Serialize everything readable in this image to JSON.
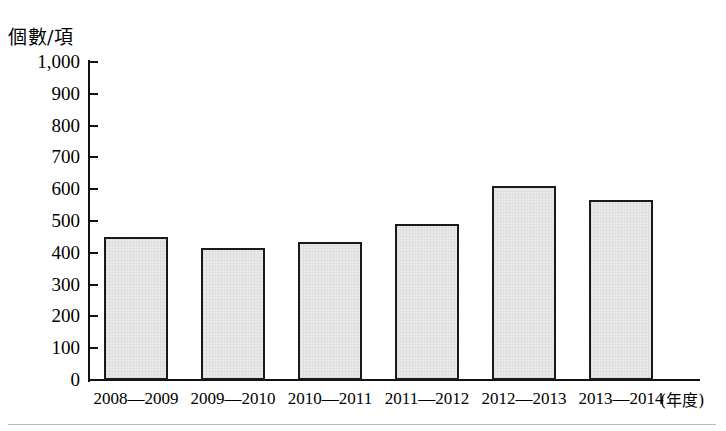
{
  "chart_data": {
    "type": "bar",
    "title": "",
    "subtitle": "",
    "ylabel": "個數/項",
    "xlabel": "(年度)",
    "categories": [
      "2008—2009",
      "2009—2010",
      "2010—2011",
      "2011—2012",
      "2012—2013",
      "2013—2014"
    ],
    "values": [
      450,
      415,
      435,
      490,
      610,
      565
    ],
    "series": [
      {
        "name": "個數/項",
        "values": [
          450,
          415,
          435,
          490,
          610,
          565
        ]
      }
    ],
    "ylim": [
      0,
      1000
    ],
    "ytick_labels": [
      "1,000",
      "900",
      "800",
      "700",
      "600",
      "500",
      "400",
      "300",
      "200",
      "100",
      "0"
    ],
    "ytick_values": [
      1000,
      900,
      800,
      700,
      600,
      500,
      400,
      300,
      200,
      100,
      0
    ],
    "grid": false,
    "legend": false,
    "legend_position": "none",
    "annotations": [],
    "colors": {
      "bar_fill": "#e9e9e9",
      "bar_border": "#1a1a1a",
      "axis": "#111111",
      "text": "#000000",
      "page_rule": "#b9b9b9"
    }
  }
}
